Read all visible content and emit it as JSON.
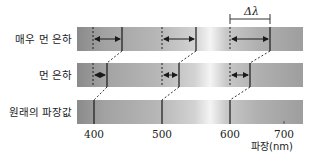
{
  "rows": [
    {
      "label": "매우 먼 은하",
      "shifted_nm": [
        441,
        550,
        659
      ]
    },
    {
      "label": "먼 은하",
      "shifted_nm": [
        420,
        525,
        630
      ]
    },
    {
      "label": "원래의 파장값",
      "reference_nm": [
        400,
        500,
        600
      ]
    }
  ],
  "axis": {
    "ticks": [
      "400",
      "500",
      "600",
      "700"
    ],
    "title": "파장(nm)"
  },
  "annotation": {
    "delta_label": "Δλ"
  },
  "colors": {
    "bar_dark": "#8c8c8c",
    "bar_mid": "#b4b4b4",
    "bar_light": "#f2f2f2",
    "line": "#1a1a1a"
  }
}
